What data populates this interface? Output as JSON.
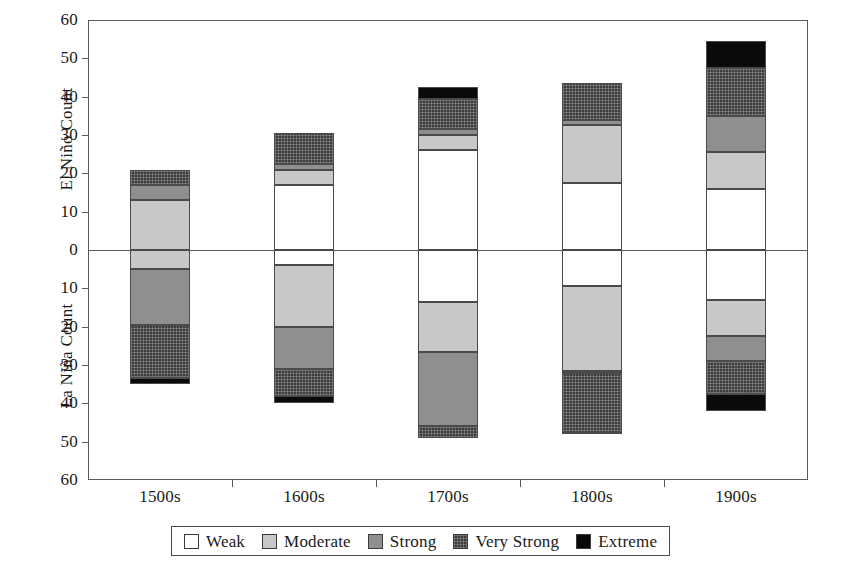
{
  "chart_data": {
    "type": "bar",
    "subtype": "stacked-diverging-bar",
    "title": "",
    "xlabel": "",
    "ylabel_top": "El Niño Count",
    "ylabel_bottom": "La Niña Count",
    "categories": [
      "1500s",
      "1600s",
      "1700s",
      "1800s",
      "1900s"
    ],
    "ylim": [
      -60,
      60
    ],
    "y_ticks_top": [
      60,
      50,
      40,
      30,
      20,
      10,
      0
    ],
    "y_ticks_bottom": [
      10,
      20,
      30,
      40,
      50,
      60
    ],
    "y_tick_labels": [
      "60",
      "50",
      "40",
      "30",
      "20",
      "10",
      "0",
      "10",
      "20",
      "30",
      "40",
      "50",
      "60"
    ],
    "y_tick_interval": 10,
    "grid": false,
    "legend_position": "bottom",
    "legend": [
      "Weak",
      "Moderate",
      "Strong",
      "Very Strong",
      "Extreme"
    ],
    "series": [
      {
        "name": "Weak",
        "key": "weak",
        "color": "#ffffff",
        "el_nino": [
          0,
          17,
          26,
          17.5,
          16
        ],
        "la_nina": [
          0,
          4,
          13.5,
          9.5,
          13
        ]
      },
      {
        "name": "Moderate",
        "key": "moderate",
        "color": "#c8c8c8",
        "el_nino": [
          13,
          4,
          4,
          15,
          9.5
        ],
        "la_nina": [
          5,
          16,
          13,
          22,
          9.5
        ]
      },
      {
        "name": "Strong",
        "key": "strong",
        "color": "#8f8f8f",
        "el_nino": [
          4,
          1.5,
          1.5,
          1.5,
          9.5
        ],
        "la_nina": [
          14.5,
          11,
          19.5,
          0.5,
          6.5
        ]
      },
      {
        "name": "Very Strong",
        "key": "verystrong",
        "color": "#3c3c3c",
        "el_nino": [
          4,
          8,
          8,
          9.5,
          12.5
        ],
        "la_nina": [
          14,
          7,
          3,
          15.5,
          8.5
        ]
      },
      {
        "name": "Extreme",
        "key": "extreme",
        "color": "#0a0a0a",
        "el_nino": [
          0,
          0,
          3,
          0,
          7
        ],
        "la_nina": [
          1.5,
          2,
          0,
          0.5,
          4.5
        ]
      }
    ],
    "el_nino_totals": [
      21,
      30.5,
      42.5,
      43.5,
      54.5
    ],
    "la_nina_totals": [
      35,
      40,
      49,
      48,
      42
    ]
  },
  "axis": {
    "ylabel_top": "El Niño Count",
    "ylabel_bottom": "La Niña Count"
  }
}
